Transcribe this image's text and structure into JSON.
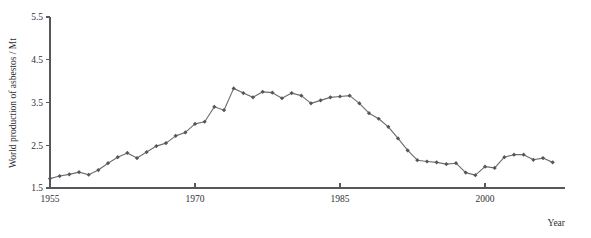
{
  "chart_data": {
    "type": "line",
    "title": "",
    "xlabel": "Year",
    "ylabel": "World production of asbestos / Mt",
    "xlim": [
      1954,
      2008
    ],
    "ylim": [
      1.5,
      5.5
    ],
    "xticks": [
      1955,
      1970,
      1985,
      2000
    ],
    "yticks": [
      1.5,
      2.5,
      3.5,
      4.5,
      5.5
    ],
    "xtick_labels": [
      "1955",
      "1970",
      "1985",
      "2000"
    ],
    "ytick_labels": [
      "1.5",
      "2.5",
      "3.5",
      "4.5",
      "5.5"
    ],
    "grid": false,
    "legend": false,
    "marker": "diamond",
    "line_color": "#6d6e72",
    "marker_color": "#55565a",
    "axis_color": "#57585c",
    "background_color": "#ffffff",
    "x": [
      1955,
      1956,
      1957,
      1958,
      1959,
      1960,
      1961,
      1962,
      1963,
      1964,
      1965,
      1966,
      1967,
      1968,
      1969,
      1970,
      1971,
      1972,
      1973,
      1974,
      1975,
      1976,
      1977,
      1978,
      1979,
      1980,
      1981,
      1982,
      1983,
      1984,
      1985,
      1986,
      1987,
      1988,
      1989,
      1990,
      1991,
      1992,
      1993,
      1994,
      1995,
      1996,
      1997,
      1998,
      1999,
      2000,
      2001,
      2002,
      2003,
      2004,
      2005,
      2006,
      2007
    ],
    "values": [
      1.72,
      1.78,
      1.82,
      1.87,
      1.81,
      1.92,
      2.08,
      2.22,
      2.32,
      2.2,
      2.34,
      2.48,
      2.55,
      2.72,
      2.8,
      3.0,
      3.05,
      3.4,
      3.32,
      3.83,
      3.72,
      3.62,
      3.75,
      3.73,
      3.6,
      3.72,
      3.66,
      3.48,
      3.55,
      3.62,
      3.64,
      3.66,
      3.48,
      3.25,
      3.12,
      2.93,
      2.66,
      2.38,
      2.15,
      2.12,
      2.1,
      2.06,
      2.08,
      1.86,
      1.8,
      2.0,
      1.97,
      2.22,
      2.28,
      2.28,
      2.16,
      2.2,
      2.1
    ],
    "series": [
      {
        "name": "World production of asbestos",
        "values": [
          1.72,
          1.78,
          1.82,
          1.87,
          1.81,
          1.92,
          2.08,
          2.22,
          2.32,
          2.2,
          2.34,
          2.48,
          2.55,
          2.72,
          2.8,
          3.0,
          3.05,
          3.4,
          3.32,
          3.83,
          3.72,
          3.62,
          3.75,
          3.73,
          3.6,
          3.72,
          3.66,
          3.48,
          3.55,
          3.62,
          3.64,
          3.66,
          3.48,
          3.25,
          3.12,
          2.93,
          2.66,
          2.38,
          2.15,
          2.12,
          2.1,
          2.06,
          2.08,
          1.86,
          1.8,
          2.0,
          1.97,
          2.22,
          2.28,
          2.28,
          2.16,
          2.2,
          2.1
        ]
      }
    ],
    "annotations": []
  }
}
